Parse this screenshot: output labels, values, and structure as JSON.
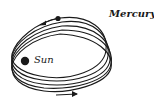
{
  "diagram": {
    "labels": {
      "mercury": "Mercury",
      "sun": "Sun"
    },
    "colors": {
      "ink": "#1a1a1a",
      "background": "#ffffff"
    },
    "orbit_count": 5
  }
}
